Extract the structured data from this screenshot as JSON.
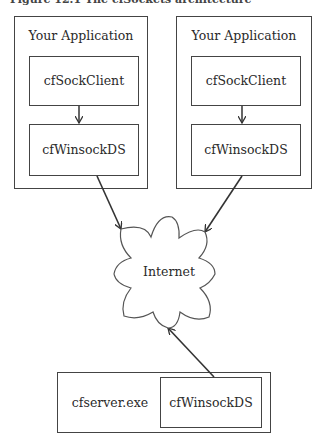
{
  "caption": "Figure 12.1  The cfSockets architecture",
  "apps": [
    {
      "title": "Your Application",
      "top_component": "cfSockClient",
      "bottom_component": "cfWinsockDS"
    },
    {
      "title": "Your Application",
      "top_component": "cfSockClient",
      "bottom_component": "cfWinsockDS"
    }
  ],
  "cloud": {
    "label": "Internet"
  },
  "server": {
    "label": "cfserver.exe",
    "component": "cfWinsockDS"
  },
  "colors": {
    "line": "#333333",
    "background": "#ffffff"
  }
}
